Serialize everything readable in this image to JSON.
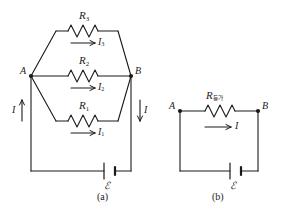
{
  "figure": {
    "background_color": "#ffffff",
    "line_color": "#1a1a1a",
    "panel_a": {
      "caption": "(a)",
      "node_a_label": "A",
      "node_b_label": "B",
      "main_current_in_label": "I",
      "main_current_out_label": "I",
      "branches": [
        {
          "resistor_label": "R",
          "resistor_subscript": "3",
          "current_label": "I",
          "current_subscript": "3",
          "arrow_direction": "right"
        },
        {
          "resistor_label": "R",
          "resistor_subscript": "2",
          "current_label": "I",
          "current_subscript": "2",
          "arrow_direction": "right"
        },
        {
          "resistor_label": "R",
          "resistor_subscript": "1",
          "current_label": "I",
          "current_subscript": "1",
          "arrow_direction": "right"
        }
      ],
      "battery_label": "ℰ"
    },
    "panel_b": {
      "caption": "(b)",
      "node_a_label": "A",
      "node_b_label": "B",
      "resistor_label": "R",
      "resistor_subscript": "등가",
      "current_label": "I",
      "arrow_direction": "right",
      "battery_label": "ℰ"
    }
  }
}
